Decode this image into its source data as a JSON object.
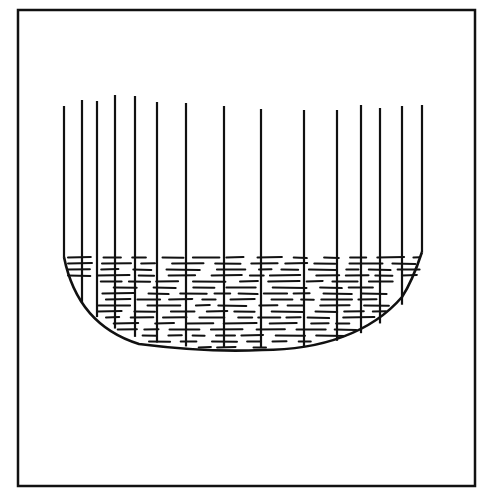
{
  "figure": {
    "stroke_color": "#111111",
    "background": "#ffffff",
    "frame": {
      "x": 18,
      "y": 10,
      "w": 457,
      "h": 476
    },
    "bowl": {
      "left_x": 64,
      "left_rim_y": 257,
      "right_x": 422,
      "right_rim_y": 252,
      "bottom_y": 350,
      "bottom_x": 262
    },
    "vertical_lines": [
      {
        "x": 64,
        "top": 106
      },
      {
        "x": 82,
        "top": 100
      },
      {
        "x": 97,
        "top": 101
      },
      {
        "x": 115,
        "top": 95
      },
      {
        "x": 135,
        "top": 96
      },
      {
        "x": 157,
        "top": 102
      },
      {
        "x": 186,
        "top": 103
      },
      {
        "x": 224,
        "top": 106
      },
      {
        "x": 261,
        "top": 109
      },
      {
        "x": 304,
        "top": 110
      },
      {
        "x": 337,
        "top": 110
      },
      {
        "x": 361,
        "top": 105
      },
      {
        "x": 380,
        "top": 108
      },
      {
        "x": 402,
        "top": 106
      },
      {
        "x": 422,
        "top": 105
      }
    ]
  }
}
